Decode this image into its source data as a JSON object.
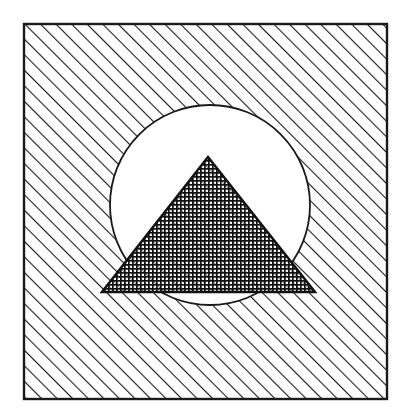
{
  "figure": {
    "colors": {
      "background": "#ffffff",
      "ink": "#1a1a1a",
      "paper": "#ffffff"
    },
    "square": {
      "x": 24,
      "y": 24,
      "width": 363,
      "height": 375,
      "fill": "diagonal-hatch"
    },
    "circle": {
      "cx": 210,
      "cy": 205,
      "r": 100,
      "fill": "white"
    },
    "triangle": {
      "points": [
        [
          208,
          157
        ],
        [
          102,
          292
        ],
        [
          315,
          292
        ]
      ],
      "fill": "dense-crosshatch"
    },
    "hatch": {
      "spacing": 11,
      "stroke_width": 2.2,
      "angle_deg": -45
    },
    "crosshatch": {
      "spacing": 4,
      "stroke_width": 1.6
    }
  }
}
